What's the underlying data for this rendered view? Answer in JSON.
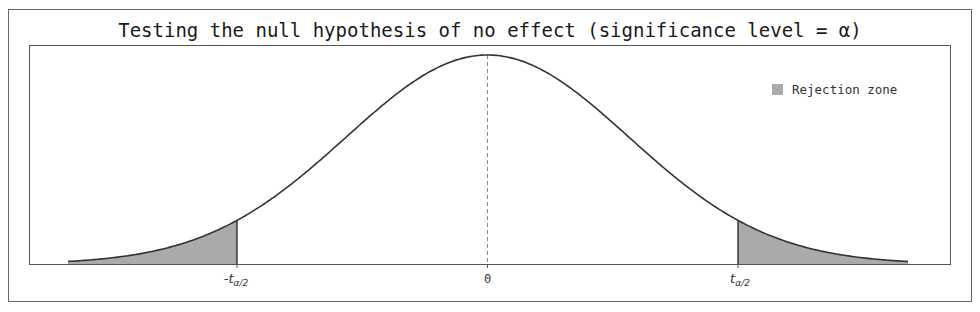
{
  "chart_data": {
    "type": "area",
    "title": "Testing the null hypothesis of no effect (significance level = α)",
    "xlabel": "",
    "ylabel": "",
    "x_ticks": [
      {
        "value": "-t_{α/2}",
        "label_main": "-t",
        "label_sub": "α/2"
      },
      {
        "value": 0,
        "label_main": "0",
        "label_sub": ""
      },
      {
        "value": "t_{α/2}",
        "label_main": "t",
        "label_sub": "α/2"
      }
    ],
    "distribution": "t / normal density curve centered at 0",
    "critical_values": {
      "lower": "-t_{α/2}",
      "upper": "t_{α/2}",
      "approx_sd_units": 1.77
    },
    "series": [
      {
        "name": "Density curve",
        "color": "#333333"
      },
      {
        "name": "Rejection zone",
        "color": "#aaaaaa",
        "regions": [
          "x < -t_{α/2}",
          "x > t_{α/2}"
        ]
      }
    ],
    "annotations": [
      {
        "type": "vertical-dashed-line",
        "x": 0
      }
    ],
    "legend": {
      "position": "upper right",
      "entries": [
        "Rejection zone"
      ]
    },
    "grid": false
  },
  "title": "Testing the null hypothesis of no effect (significance level = α)",
  "legend": {
    "label": "Rejection zone",
    "swatch_color": "#aaaaaa"
  },
  "ticks": {
    "left": {
      "main": "-t",
      "sub": "α/2"
    },
    "center": {
      "main": "0"
    },
    "right": {
      "main": "t",
      "sub": "α/2"
    }
  },
  "colors": {
    "curve": "#333333",
    "fill": "#aaaaaa",
    "frame": "#555555",
    "dashed": "#888888"
  }
}
